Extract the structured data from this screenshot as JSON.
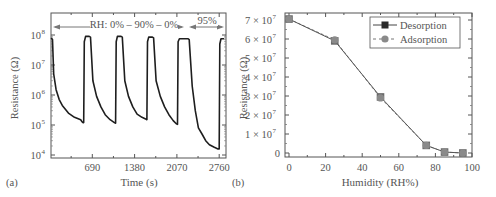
{
  "chart_data": [
    {
      "panel": "(a)",
      "type": "line",
      "title": "",
      "xlabel": "Time (s)",
      "ylabel": "Resistance (Ω)",
      "yscale": "log",
      "xlim": [
        0,
        2850
      ],
      "ylim": [
        10000,
        400000000
      ],
      "xticks": [
        690,
        1380,
        2070,
        2760
      ],
      "yticks": [
        {
          "value": 10000,
          "label": "10",
          "exp": "4"
        },
        {
          "value": 100000,
          "label": "10",
          "exp": "5"
        },
        {
          "value": 1000000,
          "label": "10",
          "exp": "6"
        },
        {
          "value": 10000000,
          "label": "10",
          "exp": "7"
        },
        {
          "value": 100000000,
          "label": "10",
          "exp": "8"
        }
      ],
      "annotations": [
        {
          "text": "RH: 0% – 90% – 0%",
          "x_start": 0,
          "x_end": 2270,
          "type": "double-arrow"
        },
        {
          "text": "95%",
          "x_start": 2290,
          "x_end": 2840,
          "type": "double-arrow"
        }
      ],
      "grid": false,
      "series": [
        {
          "name": "Resistance",
          "color": "#222222",
          "points": [
            [
              20,
              80000000
            ],
            [
              40,
              70000000
            ],
            [
              60,
              5000000
            ],
            [
              100,
              1500000
            ],
            [
              150,
              700000
            ],
            [
              200,
              450000
            ],
            [
              300,
              250000
            ],
            [
              400,
              180000
            ],
            [
              500,
              150000
            ],
            [
              520,
              130000
            ],
            [
              540,
              120000
            ],
            [
              550,
              120000
            ],
            [
              560,
              60000000
            ],
            [
              580,
              90000000
            ],
            [
              640,
              90000000
            ],
            [
              660,
              85000000
            ],
            [
              700,
              3000000
            ],
            [
              760,
              900000
            ],
            [
              830,
              400000
            ],
            [
              900,
              220000
            ],
            [
              980,
              150000
            ],
            [
              1050,
              120000
            ],
            [
              1070,
              115000
            ],
            [
              1080,
              60000000
            ],
            [
              1100,
              90000000
            ],
            [
              1160,
              90000000
            ],
            [
              1180,
              85000000
            ],
            [
              1220,
              3000000
            ],
            [
              1280,
              900000
            ],
            [
              1350,
              400000
            ],
            [
              1420,
              230000
            ],
            [
              1500,
              180000
            ],
            [
              1560,
              160000
            ],
            [
              1580,
              150000
            ],
            [
              1590,
              60000000
            ],
            [
              1610,
              85000000
            ],
            [
              1670,
              85000000
            ],
            [
              1690,
              80000000
            ],
            [
              1730,
              3000000
            ],
            [
              1800,
              900000
            ],
            [
              1870,
              400000
            ],
            [
              1940,
              220000
            ],
            [
              2010,
              140000
            ],
            [
              2060,
              110000
            ],
            [
              2080,
              105000
            ],
            [
              2090,
              60000000
            ],
            [
              2110,
              75000000
            ],
            [
              2250,
              75000000
            ],
            [
              2270,
              70000000
            ],
            [
              2320,
              2000000
            ],
            [
              2370,
              300000
            ],
            [
              2420,
              80000
            ],
            [
              2480,
              50000
            ],
            [
              2540,
              30000
            ],
            [
              2600,
              22000
            ],
            [
              2680,
              18000
            ],
            [
              2740,
              16000
            ],
            [
              2760,
              16000
            ],
            [
              2770,
              50000000
            ],
            [
              2790,
              75000000
            ],
            [
              2840,
              75000000
            ]
          ]
        }
      ]
    },
    {
      "panel": "(b)",
      "type": "line",
      "title": "",
      "xlabel": "Humidity (RH%)",
      "ylabel": "Resistance (Ω)",
      "xlim": [
        -1.5,
        100
      ],
      "ylim": [
        -1000000,
        72000000
      ],
      "xticks": [
        0,
        20,
        40,
        60,
        80,
        100
      ],
      "yticks": [
        {
          "value": 0,
          "label": "0"
        },
        {
          "value": 10000000,
          "label": "1 × 10",
          "exp": "7"
        },
        {
          "value": 20000000,
          "label": "2 × 10",
          "exp": "7"
        },
        {
          "value": 30000000,
          "label": "3 × 10",
          "exp": "7"
        },
        {
          "value": 40000000,
          "label": "4 × 10",
          "exp": "7"
        },
        {
          "value": 50000000,
          "label": "5 × 10",
          "exp": "7"
        },
        {
          "value": 60000000,
          "label": "6 × 10",
          "exp": "7"
        },
        {
          "value": 70000000,
          "label": "7 × 10",
          "exp": "7"
        }
      ],
      "legend": {
        "position": "upper right"
      },
      "grid": false,
      "series": [
        {
          "name": "Desorption",
          "marker": "square",
          "line": "solid",
          "color": "#222222",
          "x": [
            0,
            25,
            50,
            75,
            85,
            95
          ],
          "y": [
            70500000,
            59000000,
            29500000,
            4000000,
            500000,
            0
          ]
        },
        {
          "name": "Adsorption",
          "marker": "circle",
          "line": "dashed",
          "color": "#888888",
          "x": [
            0,
            25,
            50,
            75,
            85,
            95
          ],
          "y": [
            70500000,
            59500000,
            29000000,
            4000000,
            500000,
            0
          ]
        }
      ]
    }
  ],
  "labels": {
    "panel_a": "(a)",
    "panel_b": "(b)",
    "a_xlabel": "Time (s)",
    "a_ylabel": "Resistance (Ω)",
    "b_xlabel": "Humidity (RH%)",
    "b_ylabel": "Resistance (Ω)",
    "a_annot1": "RH: 0% – 90% – 0%",
    "a_annot2": "95%",
    "legend_desorption": "Desorption",
    "legend_adsorption": "Adsorption"
  },
  "colors": {
    "axis": "#555555",
    "curve": "#1e1e1e",
    "desorption_marker": "#2a2a2a",
    "adsorption_marker": "#8a8a8a",
    "line_gray": "#777777"
  }
}
